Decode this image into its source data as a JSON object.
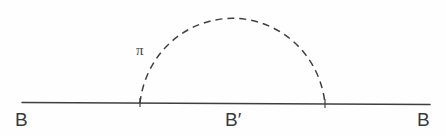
{
  "figure": {
    "type": "feynman-diagram",
    "background_color": "#fefefe",
    "stroke_color": "#3f3f3f",
    "canvas": {
      "width": 446,
      "height": 136
    }
  },
  "baseline": {
    "name": "baryon-propagator-line",
    "style": "solid",
    "stroke_color": "#3f3f3f",
    "stroke_width": 1.6,
    "x_start": 22,
    "y_start": 102.5,
    "x_end": 430,
    "y_end": 104.5
  },
  "loop": {
    "name": "pion-loop-arc",
    "style": "dashed",
    "stroke_color": "#3f3f3f",
    "stroke_width": 1.5,
    "dash_pattern": "7 5",
    "left_vertex_x": 140,
    "left_vertex_y": 103,
    "right_vertex_x": 325,
    "right_vertex_y": 104,
    "apex_x": 232,
    "apex_y": 8,
    "radius_x": 93,
    "radius_y": 95
  },
  "vertices": [
    {
      "name": "emission-vertex",
      "x": 140,
      "y": 103
    },
    {
      "name": "absorption-vertex",
      "x": 325,
      "y": 104
    }
  ],
  "labels": {
    "incoming_baryon": "B",
    "intermediate_baryon": "B′",
    "outgoing_baryon": "B",
    "meson": "π"
  }
}
